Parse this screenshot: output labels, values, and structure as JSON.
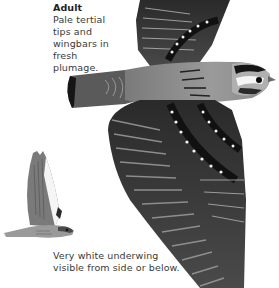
{
  "plate": {
    "captions": {
      "adult": {
        "title": "Adult",
        "text": "Pale tertial tips and wingbars in fresh plumage."
      },
      "underwing": {
        "text": "Very white underwing visible from side or below."
      }
    },
    "illustrations": {
      "large": {
        "label": "adult-in-flight-dorsal-view"
      },
      "small": {
        "label": "bird-in-flight-side-view"
      }
    },
    "colors": {
      "background": "#ffffff",
      "text": "#3a3a3a",
      "plumage_dark": "#1a1a1a",
      "plumage_mid": "#6e6e6e",
      "plumage_light": "#bdbdbd"
    }
  }
}
